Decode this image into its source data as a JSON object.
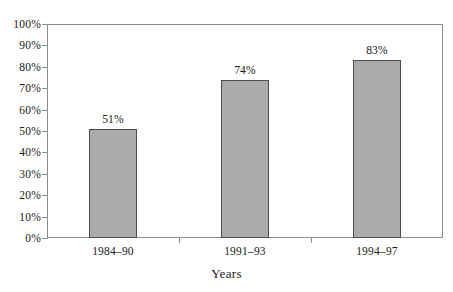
{
  "chart_data": {
    "type": "bar",
    "title": "",
    "subtitle": "",
    "xlabel": "Years",
    "ylabel": "",
    "categories": [
      "1984–90",
      "1991–93",
      "1994–97"
    ],
    "values": [
      51,
      74,
      83
    ],
    "data_labels": [
      "51%",
      "74%",
      "83%"
    ],
    "ylim": [
      0,
      100
    ],
    "y_tick_values": [
      100,
      90,
      80,
      70,
      60,
      50,
      40,
      30,
      20,
      10,
      0
    ],
    "y_tick_labels": [
      "100%",
      "90%",
      "80%",
      "70%",
      "60%",
      "50%",
      "40%",
      "30%",
      "20%",
      "10%",
      "0%"
    ],
    "grid": false,
    "legend": null,
    "legend_position": "none",
    "bar_fill_color": "#ababab",
    "bar_border_color": "#4d4d4d",
    "axis_color": "#8c8c8c",
    "background_color": "#ffffff",
    "text_color": "#1a1a1a"
  },
  "axis": {
    "x_title": "Years"
  }
}
